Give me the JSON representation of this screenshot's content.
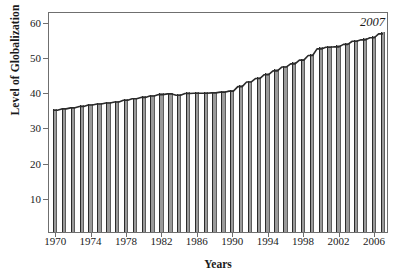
{
  "chart_data": {
    "type": "bar",
    "title": "",
    "xlabel": "Years",
    "ylabel": "Level of Globalization",
    "xlim": [
      1969.3,
      2007.7
    ],
    "ylim": [
      0,
      62.8
    ],
    "grid": false,
    "legend": null,
    "ytick_labels": [
      "10",
      "20",
      "30",
      "40",
      "50",
      "60"
    ],
    "ytick_values": [
      10,
      20,
      30,
      40,
      50,
      60
    ],
    "xtick_labels": [
      "1970",
      "1974",
      "1978",
      "1982",
      "1986",
      "1990",
      "1994",
      "1998",
      "2002",
      "2006"
    ],
    "xtick_values": [
      1970,
      1974,
      1978,
      1982,
      1986,
      1990,
      1994,
      1998,
      2002,
      2006
    ],
    "categories": [
      1970,
      1971,
      1972,
      1973,
      1974,
      1975,
      1976,
      1977,
      1978,
      1979,
      1980,
      1981,
      1982,
      1983,
      1984,
      1985,
      1986,
      1987,
      1988,
      1989,
      1990,
      1991,
      1992,
      1993,
      1994,
      1995,
      1996,
      1997,
      1998,
      1999,
      2000,
      2001,
      2002,
      2003,
      2004,
      2005,
      2006,
      2007
    ],
    "values": [
      34.9,
      35.3,
      35.6,
      36.0,
      36.4,
      36.7,
      37.0,
      37.3,
      37.8,
      38.2,
      38.6,
      39.0,
      39.4,
      39.6,
      39.2,
      39.7,
      39.8,
      39.8,
      39.9,
      40.1,
      40.4,
      41.7,
      43.0,
      44.0,
      45.1,
      46.2,
      47.3,
      48.2,
      49.3,
      50.6,
      52.5,
      53.0,
      53.1,
      53.8,
      54.7,
      55.1,
      55.7,
      56.8
    ],
    "annotations": [
      {
        "text": "2007",
        "x": 2006.0,
        "y": 60.0
      }
    ]
  },
  "series_color": "#9a9a9a",
  "outline_color": "#2b2b2b",
  "axis_color": "#6f6f6f"
}
